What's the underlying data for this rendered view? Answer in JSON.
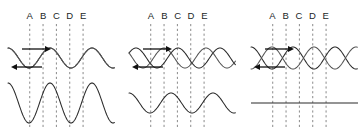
{
  "figure": {
    "colors": {
      "wave": "#2b2b2b",
      "wave_secondary": "#555555",
      "dashed_guide": "#8a8a8a",
      "label_text": "#221f1f",
      "arrow": "#111111",
      "background": "#ffffff"
    },
    "guide_labels": [
      "A",
      "B",
      "C",
      "D",
      "E"
    ],
    "guide_x_fractions": [
      0.245,
      0.355,
      0.465,
      0.575,
      0.685
    ]
  },
  "panels": [
    {
      "id": "panel-constructive",
      "name": "constructive-interference",
      "labels": [
        "A",
        "B",
        "C",
        "D",
        "E"
      ],
      "arrows": [
        {
          "name": "arrow-right",
          "direction": "right"
        },
        {
          "name": "arrow-left",
          "direction": "left"
        }
      ],
      "upper": {
        "description": "two identical waves exactly in phase, drawn overlapping",
        "waves": [
          {
            "name": "wave-rightward",
            "amplitude": 10,
            "wavelength": 42,
            "phase_deg": 0
          },
          {
            "name": "wave-leftward",
            "amplitude": 10,
            "wavelength": 42,
            "phase_deg": 0
          }
        ]
      },
      "lower": {
        "description": "resultant wave, doubled amplitude",
        "wave": {
          "name": "resultant-wave",
          "amplitude": 20,
          "wavelength": 42,
          "phase_deg": 0
        }
      }
    },
    {
      "id": "panel-partial",
      "name": "partial-interference",
      "labels": [
        "A",
        "B",
        "C",
        "D",
        "E"
      ],
      "arrows": [
        {
          "name": "arrow-right",
          "direction": "right"
        },
        {
          "name": "arrow-left",
          "direction": "left"
        }
      ],
      "upper": {
        "description": "two identical waves offset by a partial phase difference",
        "waves": [
          {
            "name": "wave-rightward",
            "amplitude": 10,
            "wavelength": 42,
            "phase_deg": -60
          },
          {
            "name": "wave-leftward",
            "amplitude": 10,
            "wavelength": 42,
            "phase_deg": 60
          }
        ]
      },
      "lower": {
        "description": "resultant wave, reduced amplitude",
        "wave": {
          "name": "resultant-wave",
          "amplitude": 10,
          "wavelength": 42,
          "phase_deg": 0
        }
      }
    },
    {
      "id": "panel-destructive",
      "name": "destructive-interference",
      "labels": [
        "A",
        "B",
        "C",
        "D",
        "E"
      ],
      "arrows": [
        {
          "name": "arrow-right",
          "direction": "right"
        },
        {
          "name": "arrow-left",
          "direction": "left"
        }
      ],
      "upper": {
        "description": "two identical waves exactly 180 degrees out of phase, crossing at nodes",
        "waves": [
          {
            "name": "wave-rightward",
            "amplitude": 11,
            "wavelength": 42,
            "phase_deg": 0
          },
          {
            "name": "wave-leftward",
            "amplitude": 11,
            "wavelength": 42,
            "phase_deg": 180
          }
        ]
      },
      "lower": {
        "description": "resultant is a flat line, zero amplitude",
        "wave": {
          "name": "resultant-flat-line",
          "amplitude": 0,
          "wavelength": 42,
          "phase_deg": 0
        }
      }
    }
  ]
}
